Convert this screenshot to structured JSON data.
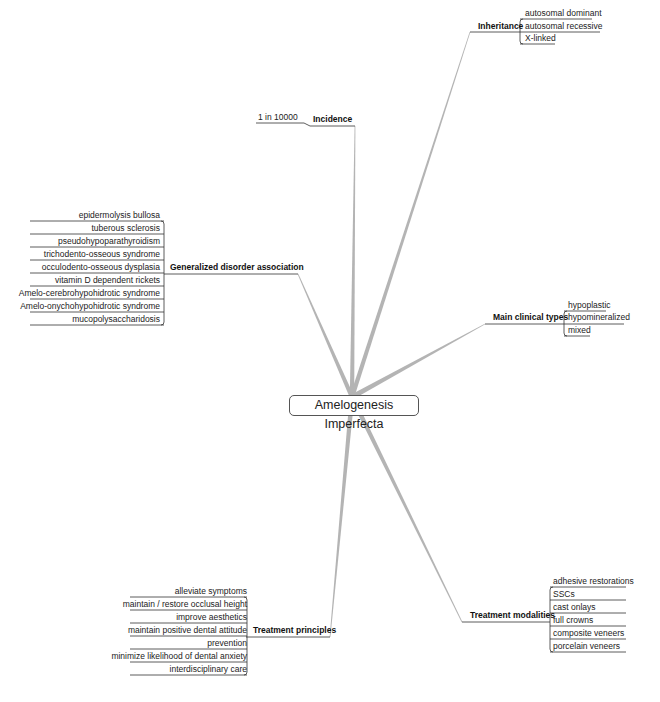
{
  "central": {
    "label": "Amelogenesis Imperfecta"
  },
  "branches": {
    "inheritance": {
      "label": "Inheritance",
      "items": [
        "autosomal dominant",
        "autosomal recessive",
        "X-linked"
      ]
    },
    "incidence": {
      "label": "Incidence",
      "items": [
        "1 in 10000"
      ]
    },
    "generalized": {
      "label": "Generalized disorder association",
      "items": [
        "epidermolysis bullosa",
        "tuberous sclerosis",
        "pseudohypoparathyroidism",
        "trichodento-osseous syndrome",
        "occulodento-osseous dysplasia",
        "vitamin D dependent rickets",
        "Amelo-cerebrohypohidrotic syndrome",
        "Amelo-onychohypohidrotic syndrome",
        "mucopolysaccharidosis"
      ]
    },
    "clinical": {
      "label": "Main clinical types",
      "items": [
        "hypoplastic",
        "hypomineralized",
        "mixed"
      ]
    },
    "principles": {
      "label": "Treatment principles",
      "items": [
        "alleviate symptoms",
        "maintain / restore occlusal height",
        "improve aesthetics",
        "maintain positive dental attitude",
        "prevention",
        "minimize likelihood of dental anxiety",
        "interdisciplinary care"
      ]
    },
    "modalities": {
      "label": "Treatment modalities",
      "items": [
        "adhesive restorations",
        "SSCs",
        "cast onlays",
        "full crowns",
        "composite veneers",
        "porcelain veneers"
      ]
    }
  },
  "colors": {
    "branch": "#b4b4b4",
    "line": "#333333"
  }
}
